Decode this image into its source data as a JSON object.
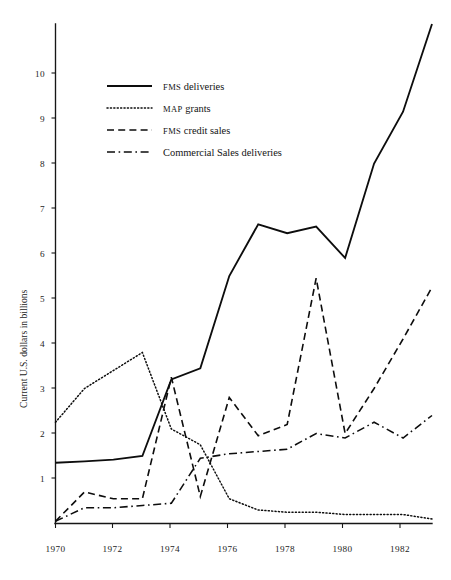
{
  "chart_data": {
    "type": "line",
    "title": "",
    "subtitle": "",
    "xlabel": "",
    "ylabel": "Current U.S. dollars in billions",
    "xlim": [
      1970,
      1983
    ],
    "ylim": [
      0,
      11.4
    ],
    "grid": false,
    "legend_position": "upper-left-inside",
    "x_tick_labels": [
      "1970",
      "1972",
      "1974",
      "1976",
      "1978",
      "1980",
      "1982"
    ],
    "x_ticks": [
      1970,
      1972,
      1974,
      1976,
      1978,
      1980,
      1982
    ],
    "y_tick_labels": [
      "1",
      "2",
      "3",
      "4",
      "5",
      "6",
      "7",
      "8",
      "9",
      "10"
    ],
    "y_ticks": [
      1,
      2,
      3,
      4,
      5,
      6,
      7,
      8,
      9,
      10
    ],
    "x": [
      1970,
      1971,
      1972,
      1973,
      1974,
      1975,
      1976,
      1977,
      1978,
      1979,
      1980,
      1981,
      1982,
      1983
    ],
    "series": [
      {
        "name": "FMS deliveries",
        "style": "solid",
        "values": [
          1.35,
          1.38,
          1.42,
          1.5,
          3.2,
          3.45,
          5.5,
          6.65,
          6.45,
          6.6,
          5.9,
          8.0,
          9.15,
          11.1
        ]
      },
      {
        "name": "MAP grants",
        "style": "dotted",
        "values": [
          2.25,
          3.0,
          3.4,
          3.8,
          2.1,
          1.75,
          0.55,
          0.3,
          0.25,
          0.25,
          0.2,
          0.2,
          0.2,
          0.1
        ]
      },
      {
        "name": "FMS credit sales",
        "style": "dashed",
        "values": [
          0.05,
          0.7,
          0.55,
          0.55,
          3.25,
          0.6,
          2.8,
          1.95,
          2.2,
          5.45,
          2.0,
          3.0,
          4.1,
          5.25
        ]
      },
      {
        "name": "Commercial Sales deliveries",
        "style": "dashdot",
        "values": [
          0.05,
          0.35,
          0.35,
          0.4,
          0.45,
          1.45,
          1.55,
          1.6,
          1.65,
          2.0,
          1.9,
          2.25,
          1.9,
          2.4
        ]
      }
    ]
  },
  "axes": {
    "y_axis_label": "Current U.S. dollars in billions",
    "y_tick_labels": [
      "10",
      "9",
      "8",
      "7",
      "6",
      "5",
      "4",
      "3",
      "2",
      "1"
    ],
    "x_tick_labels": [
      "1970",
      "1972",
      "1974",
      "1976",
      "1978",
      "1980",
      "1982"
    ]
  },
  "legend": {
    "entries": [
      {
        "swatch": "solid-line-swatch",
        "small_caps": "FMS",
        "rest": " deliveries"
      },
      {
        "swatch": "dotted-line-swatch",
        "small_caps": "MAP",
        "rest": " grants"
      },
      {
        "swatch": "dashed-line-swatch",
        "small_caps": "FMS",
        "rest": " credit sales"
      },
      {
        "swatch": "dashdot-line-swatch",
        "small_caps": "",
        "rest": "Commercial Sales deliveries"
      }
    ]
  }
}
